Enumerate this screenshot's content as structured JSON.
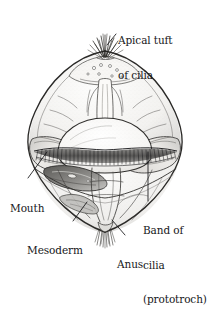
{
  "figure": {
    "width": 210,
    "height": 260,
    "background_color": "#ffffff",
    "ink_color": "#1a1a1d",
    "shading_color": "#9a9aa0",
    "fill_color": "#f2f2f0"
  },
  "labels": {
    "apical_tuft": {
      "name": "apical-tuft-of-cilia",
      "lines": [
        "Apical tuft",
        "of cilia"
      ],
      "line1": "Apical tuft",
      "line2": "of cilia"
    },
    "mouth": {
      "name": "mouth",
      "lines": [
        "Mouth"
      ],
      "line1": "Mouth"
    },
    "mesoderm": {
      "name": "mesoderm",
      "lines": [
        "Mesoderm"
      ],
      "line1": "Mesoderm"
    },
    "anus": {
      "name": "anus",
      "lines": [
        "Anus"
      ],
      "line1": "Anus"
    },
    "band_of_cilia": {
      "name": "band-of-cilia-prototroch",
      "lines": [
        "Band of",
        "cilia",
        "(prototroch)"
      ],
      "line1": "Band of",
      "line2": "cilia",
      "line3": "(prototroch)"
    }
  },
  "structures": [
    {
      "name": "apical-tuft",
      "label_key": "apical_tuft"
    },
    {
      "name": "mouth-opening",
      "label_key": "mouth"
    },
    {
      "name": "mesoderm-band",
      "label_key": "mesoderm"
    },
    {
      "name": "anus-opening",
      "label_key": "anus"
    },
    {
      "name": "prototroch-band",
      "label_key": "band_of_cilia"
    }
  ]
}
